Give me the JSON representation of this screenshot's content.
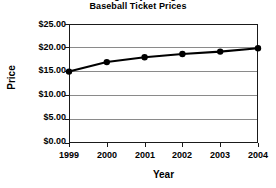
{
  "chart_data": {
    "type": "line",
    "title": "Average Major League Baseball Ticket Prices",
    "title_lines": [
      "Average Major League",
      "Baseball Ticket Prices"
    ],
    "xlabel": "Year",
    "ylabel": "Price",
    "categories": [
      "1999",
      "2000",
      "2001",
      "2002",
      "2003",
      "2004"
    ],
    "x": [
      1999,
      2000,
      2001,
      2002,
      2003,
      2004
    ],
    "values": [
      15.0,
      17.0,
      18.0,
      18.7,
      19.2,
      19.9
    ],
    "series": [
      {
        "name": "Average ticket price",
        "values": [
          15.0,
          17.0,
          18.0,
          18.7,
          19.2,
          19.9
        ]
      }
    ],
    "ylim": [
      0,
      25
    ],
    "ytick_values": [
      25,
      20,
      15,
      10,
      5,
      0
    ],
    "ytick_labels": [
      "$25.00",
      "$20.00",
      "$15.00",
      "$10.00",
      "$5.00",
      "$0.00"
    ],
    "xtick_labels": [
      "1999",
      "2000",
      "2001",
      "2002",
      "2003",
      "2004"
    ],
    "grid": true,
    "grid_axis": "y",
    "legend": false,
    "legend_position": "none",
    "marker": "filled-circle",
    "line_color": "#000000",
    "marker_color": "#000000",
    "grid_color": "#8a8a8a",
    "axis_color": "#1a1a1a",
    "background_color": "#ffffff"
  }
}
